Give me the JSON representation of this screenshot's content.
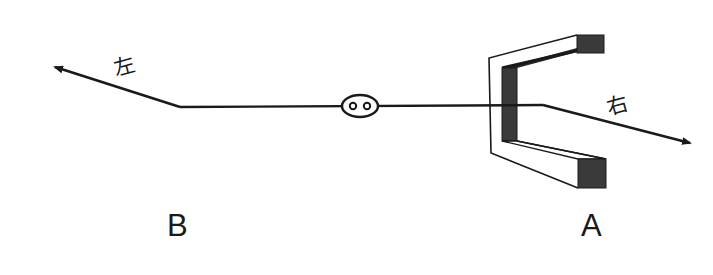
{
  "diagram": {
    "labels": {
      "left_direction": "左",
      "right_direction": "右",
      "point_b": "B",
      "point_a": "A"
    },
    "colors": {
      "line": "#1a1a1a",
      "magnet_dark": "#3a3a3a",
      "background": "#ffffff"
    }
  }
}
